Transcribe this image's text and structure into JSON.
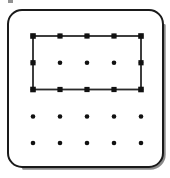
{
  "figure": {
    "kind": "geoboard-diagram",
    "canvas": {
      "width": 170,
      "height": 178,
      "background": "#ffffff"
    }
  },
  "board": {
    "name": "geoboard-frame",
    "shape": "rounded-square",
    "x": 8,
    "y": 10,
    "width": 155,
    "height": 157,
    "corner_radius": 14,
    "stroke_color": "#1a1a1a",
    "stroke_width": 2,
    "fill_color": "#ffffff",
    "shadow_color": "#8a8a8a"
  },
  "peg_grid": {
    "name": "peg-grid",
    "rows": 5,
    "columns": 5,
    "spacing_x": 27,
    "spacing_y": 26.75,
    "origin_x": 33,
    "origin_y": 36,
    "peg_radius": 2.3,
    "peg_color": "#111111",
    "column_x": [
      33,
      60,
      87,
      114,
      141
    ],
    "row_y": [
      36,
      62.75,
      89.5,
      116.5,
      143
    ]
  },
  "shape": {
    "name": "rectangle",
    "type": "rectangle",
    "stroke_color": "#2a2a2a",
    "stroke_width": 1.8,
    "fill": "none",
    "left": 33,
    "top": 36,
    "right": 141,
    "bottom": 89.5,
    "width_units": 4,
    "height_units": 2,
    "corner_pegs": [
      {
        "col": 1,
        "row": 1,
        "x": 33,
        "y": 36
      },
      {
        "col": 5,
        "row": 1,
        "x": 141,
        "y": 36
      },
      {
        "col": 5,
        "row": 3,
        "x": 141,
        "y": 89.5
      },
      {
        "col": 1,
        "row": 3,
        "x": 33,
        "y": 89.5
      }
    ]
  },
  "artifact": {
    "name": "scan-mark",
    "x": 8,
    "y": 0,
    "width": 5,
    "height": 3,
    "color": "#6d6d6d"
  },
  "colors": {
    "ink": "#1a1a1a",
    "peg": "#111111",
    "shadow": "#8a8a8a",
    "paper": "#ffffff"
  }
}
